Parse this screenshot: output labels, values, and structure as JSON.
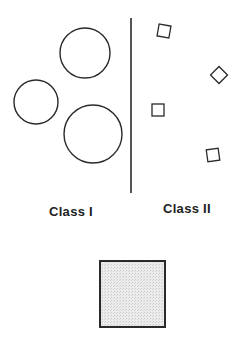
{
  "diagram": {
    "colors": {
      "stroke": "#2a2a2a",
      "background": "#ffffff",
      "query_fill": "#e4e4e4"
    },
    "divider": {
      "x": 131,
      "y1": 18,
      "y2": 193
    },
    "class_1": {
      "label": "Class I",
      "shape": "circle",
      "items": [
        {
          "cx": 85,
          "cy": 53,
          "r": 25
        },
        {
          "cx": 36,
          "cy": 102,
          "r": 22
        },
        {
          "cx": 93,
          "cy": 134,
          "r": 29
        }
      ]
    },
    "class_2": {
      "label": "Class II",
      "shape": "square",
      "items": [
        {
          "cx": 164,
          "cy": 31,
          "size": 12,
          "rotation": 10
        },
        {
          "cx": 219,
          "cy": 75,
          "size": 12,
          "rotation": 45
        },
        {
          "cx": 158,
          "cy": 110,
          "size": 12,
          "rotation": 0
        },
        {
          "cx": 213,
          "cy": 155,
          "size": 12,
          "rotation": -8
        }
      ]
    },
    "query_object": {
      "shape": "square",
      "x": 100,
      "y": 261,
      "width": 65,
      "height": 66,
      "fill": "stippled-gray"
    }
  }
}
